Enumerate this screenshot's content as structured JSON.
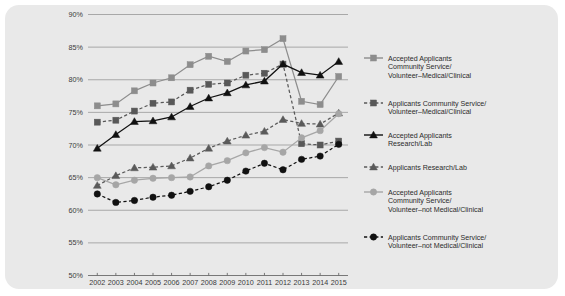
{
  "card": {
    "background": "#e9e9e9",
    "border_radius": 14
  },
  "chart_data": {
    "type": "line",
    "title": "",
    "xlabel": "",
    "ylabel": "",
    "grid": true,
    "legend_position": "right",
    "x": [
      2002,
      2003,
      2004,
      2005,
      2006,
      2007,
      2008,
      2009,
      2010,
      2011,
      2012,
      2013,
      2014,
      2015
    ],
    "categories": [
      "2002",
      "2003",
      "2004",
      "2005",
      "2006",
      "2007",
      "2008",
      "2009",
      "2010",
      "2011",
      "2012",
      "2013",
      "2014",
      "2015"
    ],
    "ylim": [
      50,
      90
    ],
    "yticks": [
      50,
      55,
      60,
      65,
      70,
      75,
      80,
      85,
      90
    ],
    "ytick_labels": [
      "50%",
      "55%",
      "60%",
      "65%",
      "70%",
      "75%",
      "80%",
      "85%",
      "90%"
    ],
    "series": [
      {
        "name": "Accepted Applicants Community Service/Volunteer–Medical/Clinical",
        "marker": "square",
        "line": "solid",
        "color": "#8d8d8d",
        "values": [
          76.0,
          76.3,
          78.3,
          79.5,
          80.3,
          82.3,
          83.6,
          82.8,
          84.4,
          84.6,
          86.3,
          76.7,
          76.2,
          80.5
        ]
      },
      {
        "name": "Applicants Community Service/Volunteer–Medical/Clinical",
        "marker": "square",
        "line": "dashed",
        "color": "#585858",
        "values": [
          73.5,
          73.8,
          75.2,
          76.4,
          76.6,
          78.4,
          79.3,
          79.5,
          80.7,
          81.0,
          82.4,
          70.2,
          70.0,
          70.6
        ]
      },
      {
        "name": "Accepted Applicants Research/Lab",
        "marker": "triangle",
        "line": "solid",
        "color": "#111111",
        "values": [
          69.5,
          71.6,
          73.6,
          73.7,
          74.3,
          75.9,
          77.2,
          78.0,
          79.2,
          79.8,
          82.4,
          81.1,
          80.7,
          82.8
        ]
      },
      {
        "name": "Applicants Research/Lab",
        "marker": "triangle",
        "line": "dashed",
        "color": "#5a5a5a",
        "values": [
          63.8,
          65.3,
          66.5,
          66.6,
          66.8,
          68.0,
          69.5,
          70.6,
          71.5,
          72.1,
          73.9,
          73.3,
          73.2,
          74.9
        ]
      },
      {
        "name": "Accepted Applicants Community Service/Volunteer–not Medical/Clinical",
        "marker": "circle",
        "line": "solid",
        "color": "#a6a6a6",
        "values": [
          65.0,
          63.9,
          64.6,
          64.9,
          65.0,
          65.1,
          66.8,
          67.6,
          68.8,
          69.6,
          68.9,
          71.1,
          72.2,
          74.8
        ]
      },
      {
        "name": "Applicants Community Service/Volunteer–not Medical/Clinical",
        "marker": "circle",
        "line": "dashed",
        "color": "#111111",
        "values": [
          62.5,
          61.2,
          61.5,
          62.0,
          62.3,
          62.9,
          63.6,
          64.6,
          66.0,
          67.2,
          66.2,
          67.8,
          68.3,
          70.1
        ]
      }
    ]
  },
  "legend": {
    "items": [
      {
        "label_lines": [
          "Accepted Applicants",
          "Community Service/",
          "Volunteer–Medical/Clinical"
        ],
        "marker": "square",
        "line": "solid",
        "color": "#8d8d8d"
      },
      {
        "label_lines": [
          "Applicants Community Service/",
          "Volunteer–Medical/Clinical"
        ],
        "marker": "square",
        "line": "dashed",
        "color": "#585858"
      },
      {
        "label_lines": [
          "Accepted Applicants",
          "Research/Lab"
        ],
        "marker": "triangle",
        "line": "solid",
        "color": "#111111"
      },
      {
        "label_lines": [
          "Applicants Research/Lab"
        ],
        "marker": "triangle",
        "line": "dashed",
        "color": "#5a5a5a"
      },
      {
        "label_lines": [
          "Accepted Applicants",
          "Community Service/",
          "Volunteer–not Medical/Clinical"
        ],
        "marker": "circle",
        "line": "solid",
        "color": "#a6a6a6"
      },
      {
        "label_lines": [
          "Applicants Community Service/",
          "Volunteer–not Medical/Clinical"
        ],
        "marker": "circle",
        "line": "dashed",
        "color": "#111111"
      }
    ]
  }
}
